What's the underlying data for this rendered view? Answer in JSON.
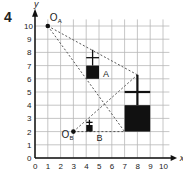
{
  "question_number": "4",
  "axes": {
    "x_label": "x",
    "y_label": "y",
    "x_ticks": [
      "0",
      "1",
      "2",
      "3",
      "4",
      "5",
      "6",
      "7",
      "8",
      "9",
      "10"
    ],
    "y_ticks": [
      "0",
      "1",
      "2",
      "3",
      "4",
      "5",
      "6",
      "7",
      "8",
      "9",
      "10"
    ]
  },
  "points": [
    {
      "name": "O",
      "sub": "A",
      "x": 1,
      "y": 10
    },
    {
      "name": "O",
      "sub": "B",
      "x": 3,
      "y": 2
    }
  ],
  "shapes": [
    {
      "label": "A",
      "square": [
        4,
        6,
        1,
        1
      ],
      "cross_x": 4.5,
      "cross_top": 8.2,
      "cross_bar_y": 7.6
    },
    {
      "label": "B",
      "square": [
        4,
        2,
        0.5,
        0.5
      ],
      "cross_x": 4.25,
      "cross_top": 2.9,
      "cross_bar_y": 2.7
    },
    {
      "label": "",
      "square": [
        7,
        2,
        2,
        2
      ],
      "cross_x": 8,
      "cross_top": 6.3,
      "cross_bar_y": 5
    }
  ],
  "rays": [
    {
      "from": [
        1,
        10
      ],
      "to": [
        8,
        6.3
      ]
    },
    {
      "from": [
        1,
        10
      ],
      "to": [
        7,
        2
      ]
    },
    {
      "from": [
        3,
        2
      ],
      "to": [
        8,
        6.3
      ]
    },
    {
      "from": [
        3,
        2
      ],
      "to": [
        7,
        2
      ]
    }
  ],
  "colors": {
    "grid": "#b8b8b8",
    "ink": "#111111"
  }
}
